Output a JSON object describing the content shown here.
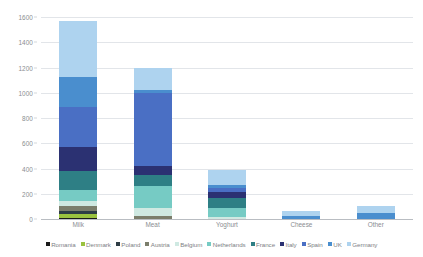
{
  "chart_data": {
    "type": "bar",
    "stacked": true,
    "title": "",
    "subtitle": "",
    "xlabel": "",
    "ylabel": "",
    "ylim": [
      0,
      1600
    ],
    "ytick_step": 200,
    "ytick_labels": [
      "0",
      "200",
      "400",
      "600",
      "800",
      "1000",
      "1200",
      "1400",
      "1600"
    ],
    "grid": true,
    "legend_position": "bottom",
    "categories": [
      "Milk",
      "Meat",
      "Yoghurt",
      "Cheese",
      "Other"
    ],
    "series": [
      {
        "name": "Romania",
        "color": "#1a1a1a",
        "values": [
          12,
          0,
          0,
          0,
          0
        ]
      },
      {
        "name": "Denmark",
        "color": "#9ac23f",
        "values": [
          28,
          0,
          0,
          0,
          0
        ]
      },
      {
        "name": "Poland",
        "color": "#2e3d46",
        "values": [
          22,
          0,
          0,
          0,
          0
        ]
      },
      {
        "name": "Austria",
        "color": "#7b7e6c",
        "values": [
          38,
          22,
          0,
          0,
          0
        ]
      },
      {
        "name": "Belgium",
        "color": "#cfe9e2",
        "values": [
          40,
          62,
          18,
          0,
          0
        ]
      },
      {
        "name": "Netherlands",
        "color": "#76cbc4",
        "values": [
          88,
          180,
          68,
          0,
          0
        ]
      },
      {
        "name": "France",
        "color": "#2e7f85",
        "values": [
          150,
          88,
          78,
          0,
          0
        ]
      },
      {
        "name": "Italy",
        "color": "#2b3172",
        "values": [
          190,
          70,
          48,
          0,
          0
        ]
      },
      {
        "name": "Spain",
        "color": "#4a6fc4",
        "values": [
          320,
          580,
          30,
          0,
          0
        ]
      },
      {
        "name": "UK",
        "color": "#4a8ece",
        "values": [
          240,
          18,
          28,
          22,
          48
        ]
      },
      {
        "name": "Germany",
        "color": "#aed3ef",
        "values": [
          440,
          180,
          122,
          38,
          52
        ]
      }
    ],
    "totals": [
      1568,
      1200,
      392,
      60,
      100
    ]
  }
}
